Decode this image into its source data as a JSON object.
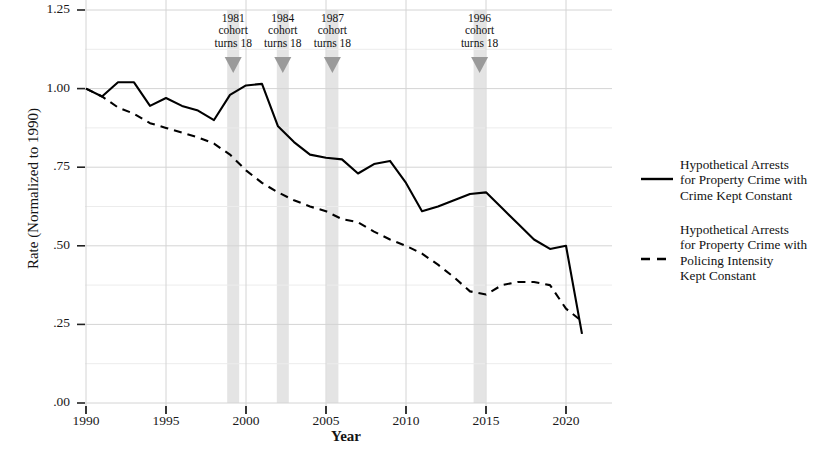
{
  "chart_data": {
    "type": "line",
    "title": "",
    "xlabel": "Year",
    "ylabel": "Rate (Normalized to 1990)",
    "xlim": [
      1990,
      2021
    ],
    "ylim": [
      0.0,
      1.25
    ],
    "grid": true,
    "legend_position": "right",
    "xticks": [
      "1990",
      "1995",
      "2000",
      "2005",
      "2010",
      "2015",
      "2020"
    ],
    "xtick_values": [
      1990,
      1995,
      2000,
      2005,
      2010,
      2015,
      2020
    ],
    "yticks": [
      ".00",
      ".25",
      ".50",
      ".75",
      "1.00",
      "1.25"
    ],
    "ytick_values": [
      0.0,
      0.25,
      0.5,
      0.75,
      1.0,
      1.25
    ],
    "x": [
      1990,
      1991,
      1992,
      1993,
      1994,
      1995,
      1996,
      1997,
      1998,
      1999,
      2000,
      2001,
      2002,
      2003,
      2004,
      2005,
      2006,
      2007,
      2008,
      2009,
      2010,
      2011,
      2012,
      2013,
      2014,
      2015,
      2016,
      2017,
      2018,
      2019,
      2020,
      2021
    ],
    "series": [
      {
        "name": "Hypothetical Arrests for Property Crime with Crime Kept Constant",
        "style": "solid",
        "color": "#000000",
        "values": [
          1.0,
          0.975,
          1.02,
          1.02,
          0.945,
          0.97,
          0.945,
          0.93,
          0.9,
          0.98,
          1.01,
          1.015,
          0.88,
          0.83,
          0.79,
          0.78,
          0.775,
          0.73,
          0.76,
          0.77,
          0.7,
          0.61,
          0.625,
          0.645,
          0.665,
          0.67,
          0.62,
          0.57,
          0.52,
          0.49,
          0.5,
          0.22
        ]
      },
      {
        "name": "Hypothetical Arrests for Property Crime with Policing Intensity Kept Constant",
        "style": "dashed",
        "color": "#000000",
        "values": [
          1.0,
          0.975,
          0.94,
          0.92,
          0.89,
          0.875,
          0.86,
          0.845,
          0.825,
          0.79,
          0.74,
          0.7,
          0.67,
          0.645,
          0.625,
          0.61,
          0.585,
          0.575,
          0.545,
          0.52,
          0.5,
          0.475,
          0.44,
          0.4,
          0.355,
          0.345,
          0.375,
          0.385,
          0.385,
          0.375,
          0.3,
          0.26
        ]
      }
    ],
    "annotations": [
      {
        "id": "a1981",
        "year": 1999.2,
        "line1": "1981",
        "line2": "cohort",
        "line3": "turns 18"
      },
      {
        "id": "a1984",
        "year": 2002.3,
        "line1": "1984",
        "line2": "cohort",
        "line3": "turns 18"
      },
      {
        "id": "a1987",
        "year": 2005.4,
        "line1": "1987",
        "line2": "cohort",
        "line3": "turns 18"
      },
      {
        "id": "a1996",
        "year": 2014.6,
        "line1": "1996",
        "line2": "cohort",
        "line3": "turns 18"
      }
    ],
    "band_color": "#e4e4e4",
    "marker_color": "#9a9a9a",
    "grid_color": "#d4d4d4"
  },
  "legend": {
    "entries": [
      {
        "line1": "Hypothetical Arrests",
        "line2": "for Property Crime with",
        "line3": "Crime Kept Constant",
        "line4": "",
        "style": "solid"
      },
      {
        "line1": "Hypothetical Arrests",
        "line2": "for Property Crime with",
        "line3": "Policing Intensity",
        "line4": "Kept Constant",
        "style": "dashed"
      }
    ]
  }
}
